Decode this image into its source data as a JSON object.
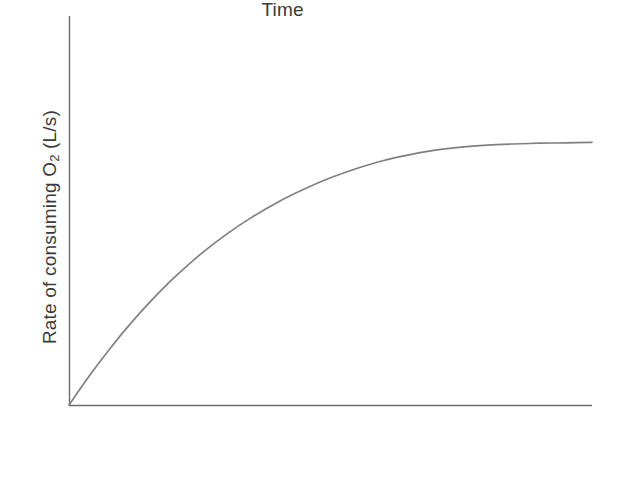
{
  "chart_data": {
    "type": "line",
    "title": "",
    "subtitle": "",
    "xlabel": "Time",
    "ylabel_parts": {
      "before": "Rate of consuming O",
      "subscript": "2",
      "after": " (L/s)"
    },
    "ylabel_text": "Rate of consuming O2 (L/s)",
    "grid": false,
    "legend": "none",
    "axis_ticks": "none",
    "xlim": [
      0,
      1
    ],
    "ylim": [
      0,
      1
    ],
    "curve_color": "#808080",
    "axis_color": "#6b6b6b",
    "text_color": "#3a3a3a",
    "background_color": "#ffffff",
    "series": [
      {
        "name": "Rate of consuming O2",
        "shape": "saturation-curve",
        "plateau_value": 0.675,
        "x": [
          0.0,
          0.04,
          0.08,
          0.12,
          0.16,
          0.2,
          0.25,
          0.3,
          0.35,
          0.4,
          0.45,
          0.5,
          0.55,
          0.6,
          0.65,
          0.7,
          0.75,
          0.8,
          0.85,
          0.9,
          0.95,
          1.0
        ],
        "y": [
          0.0,
          0.077,
          0.148,
          0.213,
          0.272,
          0.326,
          0.386,
          0.438,
          0.483,
          0.522,
          0.555,
          0.584,
          0.608,
          0.628,
          0.643,
          0.655,
          0.663,
          0.668,
          0.671,
          0.673,
          0.674,
          0.675
        ]
      }
    ]
  }
}
